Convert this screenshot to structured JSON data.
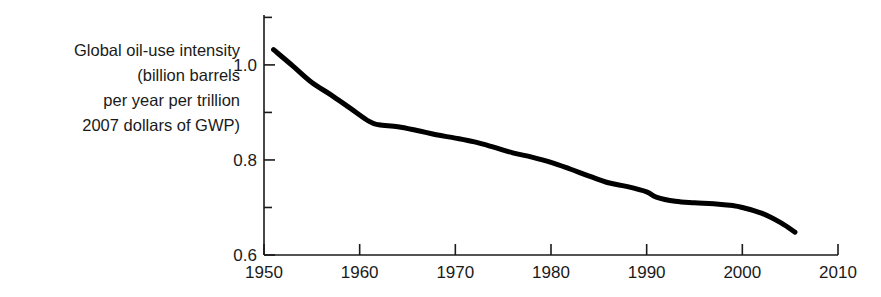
{
  "figure": {
    "width": 881,
    "height": 297,
    "background": "#ffffff",
    "line_color": "#000000",
    "axis_color": "#1a1a1a"
  },
  "axis_label": {
    "name": "y-axis-label",
    "lines": [
      "Global oil-use intensity",
      "(billion barrels",
      "per year per trillion",
      "2007 dollars of GWP)"
    ]
  },
  "xticks": [
    {
      "label": "1950",
      "value": 1950
    },
    {
      "label": "1960",
      "value": 1960
    },
    {
      "label": "1970",
      "value": 1970
    },
    {
      "label": "1980",
      "value": 1980
    },
    {
      "label": "1990",
      "value": 1990
    },
    {
      "label": "2000",
      "value": 2000
    },
    {
      "label": "2010",
      "value": 2010
    }
  ],
  "yticks": [
    {
      "label": "0.6",
      "value": 0.6
    },
    {
      "label": "",
      "value": 0.7
    },
    {
      "label": "0.8",
      "value": 0.8
    },
    {
      "label": "",
      "value": 0.9
    },
    {
      "label": "1.0",
      "value": 1.0
    },
    {
      "label": "",
      "value": 1.1
    }
  ],
  "chart_data": {
    "type": "line",
    "title": "",
    "subtitle": "",
    "xlabel": "",
    "ylabel": "Global oil-use intensity (billion barrels per year per trillion 2007 dollars of GWP)",
    "xlim": [
      1950,
      2010
    ],
    "ylim": [
      0.6,
      1.105
    ],
    "grid": false,
    "legend": false,
    "x_tick_labels": [
      "1950",
      "1960",
      "1970",
      "1980",
      "1990",
      "2000",
      "2010"
    ],
    "y_tick_labels": [
      "0.6",
      "0.8",
      "1.0"
    ],
    "y_minor_ticks": [
      0.7,
      0.9,
      1.1
    ],
    "series": [
      {
        "name": "Global oil-use intensity",
        "color": "#000000",
        "x": [
          1951,
          1953,
          1955,
          1957,
          1959,
          1961,
          1962,
          1964,
          1966,
          1968,
          1970,
          1972,
          1974,
          1976,
          1978,
          1980,
          1982,
          1984,
          1986,
          1988,
          1990,
          1991,
          1993,
          1995,
          1997,
          1999,
          2000,
          2002,
          2004,
          2005.5
        ],
        "y": [
          1.032,
          0.998,
          0.963,
          0.937,
          0.909,
          0.881,
          0.874,
          0.87,
          0.862,
          0.853,
          0.846,
          0.838,
          0.827,
          0.815,
          0.806,
          0.795,
          0.781,
          0.766,
          0.752,
          0.744,
          0.733,
          0.722,
          0.713,
          0.71,
          0.708,
          0.704,
          0.7,
          0.688,
          0.668,
          0.648
        ]
      }
    ]
  }
}
